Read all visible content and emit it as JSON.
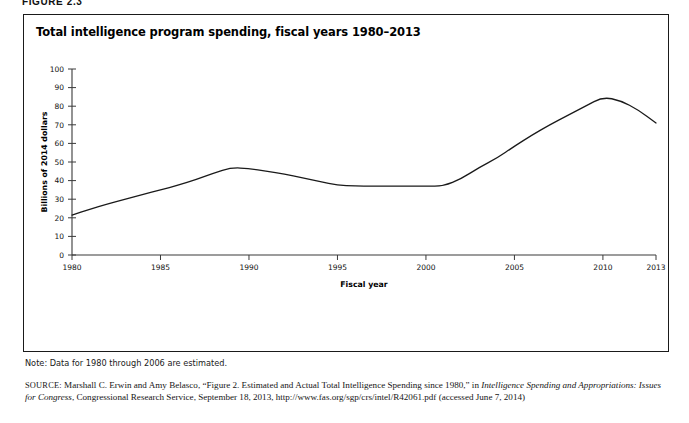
{
  "figure": {
    "label": "FIGURE 2.3",
    "title": "Total intelligence program spending, fiscal years 1980–2013",
    "note": "Note: Data for 1980 through 2006 are estimated.",
    "source": {
      "label": "SOURCE:",
      "text_part_1": " Marshall C. Erwin and Amy Belasco, “Figure 2. Estimated and Actual Total Intelligence Spending since 1980,” in ",
      "italic_1": "Intelligence Spending and Appropriations: Issues for Congress",
      "text_part_2": ", Congressional Research Service, September 18, 2013, http://www.fas.org/sgp/crs/intel/R42061.pdf (accessed June 7, 2014)"
    }
  },
  "chart_data": {
    "type": "line",
    "title": "Total intelligence program spending, fiscal years 1980–2013",
    "xlabel": "Fiscal year",
    "ylabel": "Billions of 2014 dollars",
    "xlim": [
      1980,
      2013
    ],
    "ylim": [
      0,
      100
    ],
    "ytick_labels": [
      "0",
      "10",
      "20",
      "30",
      "40",
      "50",
      "60",
      "70",
      "80",
      "90",
      "100"
    ],
    "yticks": [
      0,
      10,
      20,
      30,
      40,
      50,
      60,
      70,
      80,
      90,
      100
    ],
    "xtick_labels": [
      "1980",
      "1985",
      "1990",
      "1995",
      "2000",
      "2005",
      "2010",
      "2013"
    ],
    "xticks": [
      1980,
      1985,
      1990,
      1995,
      2000,
      2005,
      2010,
      2013
    ],
    "grid": false,
    "legend": "none",
    "series": [
      {
        "name": "Total intelligence program spending",
        "x": [
          1980,
          1981,
          1982,
          1983,
          1984,
          1985,
          1986,
          1987,
          1988,
          1989,
          1990,
          1991,
          1992,
          1993,
          1994,
          1995,
          1996,
          1997,
          1998,
          1999,
          2000,
          2001,
          2002,
          2003,
          2004,
          2005,
          2006,
          2007,
          2008,
          2009,
          2010,
          2011,
          2012,
          2013
        ],
        "values": [
          21.5,
          24.5,
          27.5,
          30.0,
          32.5,
          35.0,
          37.5,
          40.5,
          44.0,
          47.0,
          46.5,
          45.0,
          43.5,
          41.5,
          39.5,
          37.5,
          37.0,
          37.0,
          37.0,
          37.0,
          37.0,
          37.0,
          41.0,
          47.0,
          52.0,
          58.5,
          64.5,
          70.0,
          75.0,
          80.0,
          85.0,
          83.0,
          78.0,
          71.0
        ]
      }
    ]
  }
}
